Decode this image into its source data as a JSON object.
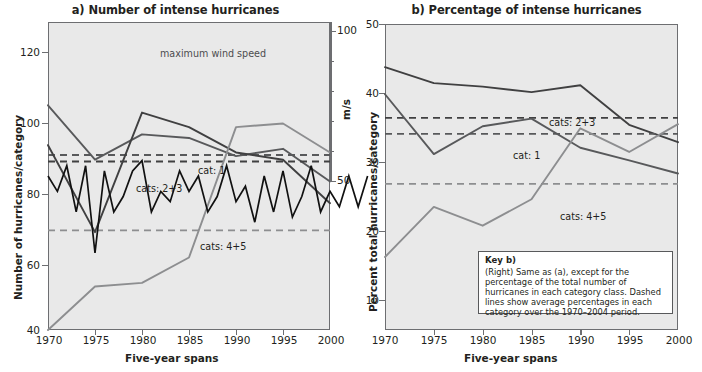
{
  "figure": {
    "panels": [
      {
        "id": "a",
        "title": "a) Number of intense hurricanes",
        "xlabel": "Five-year spans",
        "ylabel_left": "Number of hurricanes/category",
        "ylabel_right": "m/s",
        "xticks": [
          "1970",
          "1975",
          "1980",
          "1985",
          "1990",
          "1995",
          "2000"
        ],
        "yticks_left": [
          "120",
          "100",
          "80",
          "60",
          "40"
        ],
        "yticks_right": [
          "100",
          "50"
        ],
        "annotations": {
          "wind": "maximum wind speed",
          "cat1": "cat: 1",
          "cat23": "cats: 2+3",
          "cat45": "cats: 4+5"
        }
      },
      {
        "id": "b",
        "title": "b) Percentage of intense hurricanes",
        "xlabel": "Five-year spans",
        "ylabel_left": "Percent total hurricanes/category",
        "xticks": [
          "1970",
          "1975",
          "1980",
          "1985",
          "1990",
          "1995",
          "2000"
        ],
        "yticks_left": [
          "50",
          "40",
          "30",
          "20",
          "10"
        ],
        "annotations": {
          "cat1": "cat: 1",
          "cat23": "cats: 2+3",
          "cat45": "cats: 4+5"
        },
        "key": {
          "title": "Key b)",
          "text": "(Right) Same as (a), except for the percentage of the total number of hurricanes in each category class. Dashed lines show average percentages in each category over the 1970–2004 period."
        }
      }
    ],
    "colors": {
      "cat1": "#58595b",
      "cat23": "#404041",
      "cat45": "#8d8e90",
      "wind": "#111111",
      "plot_background": "#e9e9e9",
      "axis": "#6d6e71",
      "text": "#231f20"
    }
  },
  "chart_data": [
    {
      "type": "line",
      "panel": "a",
      "title": "a) Number of intense hurricanes",
      "xlabel": "Five-year spans",
      "ylabel": "Number of hurricanes/category",
      "ylabel_right": "m/s",
      "grid": false,
      "legend": "inline-labels",
      "x": [
        1970,
        1975,
        1980,
        1985,
        1990,
        1995,
        2000
      ],
      "xlim": [
        1970,
        2000
      ],
      "ylim": [
        40,
        125
      ],
      "ylim_right": [
        40,
        100
      ],
      "yticks": [
        40,
        60,
        80,
        100,
        120
      ],
      "yticks_right": [
        50,
        100
      ],
      "series": [
        {
          "name": "cat: 1",
          "color": "#58595b",
          "values": [
            102,
            87,
            94,
            93,
            88,
            90,
            81
          ],
          "average_line": 88.3,
          "average_style": "dashed"
        },
        {
          "name": "cats: 2+3",
          "color": "#404041",
          "values": [
            91,
            67,
            100,
            96,
            89,
            87,
            75
          ],
          "average_line": 86.5,
          "average_style": "dashed"
        },
        {
          "name": "cats: 4+5",
          "color": "#8d8e90",
          "values": [
            40,
            52,
            53,
            60,
            96,
            97,
            89
          ],
          "average_line": 67.5,
          "average_style": "dashed"
        },
        {
          "name": "maximum wind speed",
          "color": "#111111",
          "axis": "right",
          "units": "m/s",
          "x_annual": [
            1970,
            1971,
            1972,
            1973,
            1974,
            1975,
            1976,
            1977,
            1978,
            1979,
            1980,
            1981,
            1982,
            1983,
            1984,
            1985,
            1986,
            1987,
            1988,
            1989,
            1990,
            1991,
            1992,
            1993,
            1994,
            1995,
            1996,
            1997,
            1998,
            1999,
            2000,
            2001,
            2002,
            2003,
            2004
          ],
          "values_annual": [
            70,
            67,
            72,
            63,
            72,
            55,
            71,
            63,
            66,
            71,
            73,
            63,
            67,
            65,
            71,
            67,
            70,
            63,
            66,
            72,
            65,
            68,
            61,
            70,
            63,
            71,
            62,
            66,
            72,
            63,
            67,
            64,
            70,
            64,
            70
          ]
        }
      ],
      "annotations": [
        {
          "text": "maximum wind speed",
          "x": 1985,
          "y": 115
        },
        {
          "text": "cat: 1",
          "x": 1985,
          "y": 89
        },
        {
          "text": "cats: 2+3",
          "x": 1982,
          "y": 85
        },
        {
          "text": "cats: 4+5",
          "x": 1987,
          "y": 68
        }
      ]
    },
    {
      "type": "line",
      "panel": "b",
      "title": "b) Percentage of intense hurricanes",
      "xlabel": "Five-year spans",
      "ylabel": "Percent total hurricanes/category",
      "grid": false,
      "legend": "inline-labels",
      "x": [
        1970,
        1975,
        1980,
        1985,
        1990,
        1995,
        2000
      ],
      "xlim": [
        1970,
        2000
      ],
      "ylim": [
        6,
        50
      ],
      "yticks": [
        10,
        20,
        30,
        40,
        50
      ],
      "series": [
        {
          "name": "cats: 2+3",
          "color": "#404041",
          "values": [
            43.8,
            41.5,
            41.0,
            40.2,
            41.2,
            35.5,
            33.0
          ],
          "average_line": 36.5,
          "average_style": "dashed"
        },
        {
          "name": "cat: 1",
          "color": "#58595b",
          "values": [
            39.9,
            31.3,
            35.3,
            36.4,
            32.2,
            30.4,
            28.5
          ],
          "average_line": 34.2,
          "average_style": "dashed"
        },
        {
          "name": "cats: 4+5",
          "color": "#8d8e90",
          "values": [
            16.5,
            23.7,
            21.0,
            24.8,
            35.0,
            31.6,
            35.6
          ],
          "average_line": 27.0,
          "average_style": "dashed"
        }
      ],
      "annotations": [
        {
          "text": "cats: 2+3",
          "x": 1989,
          "y": 37.6
        },
        {
          "text": "cat: 1",
          "x": 1987,
          "y": 32.7
        },
        {
          "text": "cats: 4+5",
          "x": 1990,
          "y": 25.6
        }
      ]
    }
  ]
}
